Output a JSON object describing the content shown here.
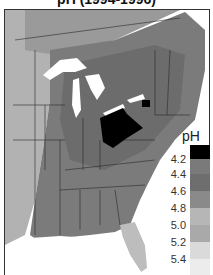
{
  "title": "pH (1994-1996)",
  "legend": {
    "title": "pH",
    "bins": [
      {
        "color": "#000000"
      },
      {
        "color": "#7a7a7a"
      },
      {
        "color": "#6e6e6e"
      },
      {
        "color": "#8a8a8a"
      },
      {
        "color": "#b6b6b6"
      },
      {
        "color": "#a9a9a9"
      },
      {
        "color": "#dadada"
      },
      {
        "color": "#ececec"
      }
    ],
    "ticks": [
      "4.2",
      "4.4",
      "4.6",
      "4.8",
      "5.0",
      "5.2",
      "5.4"
    ]
  },
  "map": {
    "region": "Eastern United States",
    "features": {
      "great_lakes_color": "#ffffff",
      "hotspot_color": "#000000",
      "hotspot_region": "Ohio / Pennsylvania / New York",
      "florida_color": "#c8c8c8",
      "western_plains_color": "#b0b0b0",
      "south_color": "#777777"
    }
  }
}
